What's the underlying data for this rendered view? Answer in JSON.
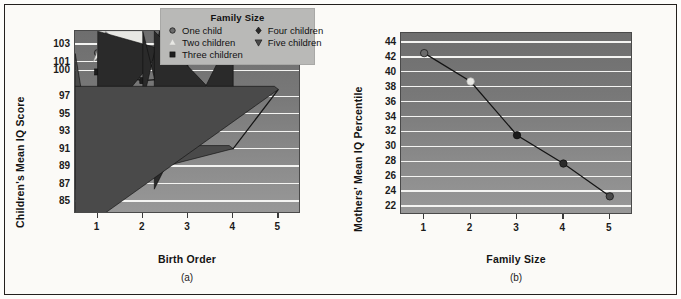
{
  "figure": {
    "background": "#fbfaf7",
    "frame_color": "#23201d"
  },
  "legend": {
    "title": "Family Size",
    "entries": [
      {
        "label": "One child",
        "marker": "circle",
        "color": "#6b6b6b",
        "column": 0
      },
      {
        "label": "Two children",
        "marker": "triangle-up",
        "color": "#e8e8e4",
        "column": 0
      },
      {
        "label": "Three children",
        "marker": "square",
        "color": "#1d1d1d",
        "column": 0
      },
      {
        "label": "Four children",
        "marker": "diamond",
        "color": "#2a2a2a",
        "column": 1
      },
      {
        "label": "Five children",
        "marker": "triangle-down",
        "color": "#4a4a4a",
        "column": 1
      }
    ]
  },
  "chart_data": [
    {
      "type": "line",
      "panel": "a",
      "caption": "(a)",
      "title": "",
      "xlabel": "Birth Order",
      "ylabel": "Children's Mean IQ Score",
      "x": [
        1,
        2,
        3,
        4,
        5
      ],
      "xticks": [
        "1",
        "2",
        "3",
        "4",
        "5"
      ],
      "yticks": [
        "103",
        "101",
        "100",
        "97",
        "95",
        "93",
        "91",
        "89",
        "87",
        "85"
      ],
      "ytick_values": [
        103,
        101,
        100,
        97,
        95,
        93,
        91,
        89,
        87,
        85
      ],
      "ylim": [
        83.5,
        104.5
      ],
      "xlim": [
        0.5,
        5.5
      ],
      "grid": true,
      "legend_position": "top-right-overlay",
      "series": [
        {
          "name": "One child",
          "marker": "circle",
          "color": "#6b6b6b",
          "x": [
            1
          ],
          "values": [
            102.0
          ]
        },
        {
          "name": "Two children",
          "marker": "triangle-up",
          "color": "#e8e8e4",
          "x": [
            1,
            2
          ],
          "values": [
            101.0,
            101.0
          ]
        },
        {
          "name": "Three children",
          "marker": "square",
          "color": "#1d1d1d",
          "x": [
            1,
            2,
            3
          ],
          "values": [
            99.8,
            98.8,
            99.2
          ]
        },
        {
          "name": "Four children",
          "marker": "diamond",
          "color": "#2a2a2a",
          "x": [
            1,
            2,
            3,
            4
          ],
          "values": [
            92.8,
            94.8,
            92.9,
            95.4
          ]
        },
        {
          "name": "Five children",
          "marker": "triangle-down",
          "color": "#4a4a4a",
          "x": [
            1,
            2,
            3,
            4,
            5
          ],
          "values": [
            86.4,
            90.9,
            91.1,
            91.0,
            97.8
          ]
        }
      ]
    },
    {
      "type": "line",
      "panel": "b",
      "caption": "(b)",
      "title": "",
      "xlabel": "Family Size",
      "ylabel": "Mothers' Mean IQ Percentile",
      "x": [
        1,
        2,
        3,
        4,
        5
      ],
      "xticks": [
        "1",
        "2",
        "3",
        "4",
        "5"
      ],
      "yticks": [
        "44",
        "42",
        "40",
        "38",
        "36",
        "34",
        "32",
        "30",
        "28",
        "26",
        "24",
        "22"
      ],
      "ytick_values": [
        44,
        42,
        40,
        38,
        36,
        34,
        32,
        30,
        28,
        26,
        24,
        22
      ],
      "ylim": [
        20.8,
        45.2
      ],
      "xlim": [
        0.5,
        5.5
      ],
      "grid": true,
      "legend_position": "none",
      "series": [
        {
          "name": "Mothers' Mean IQ Percentile",
          "marker": "circle",
          "color": "#1a1a1a",
          "line_color": "#141414",
          "x": [
            1,
            2,
            3,
            4,
            5
          ],
          "values": [
            42.5,
            38.7,
            31.5,
            27.7,
            23.3
          ],
          "point_colors": [
            "#6b6b6b",
            "#e8e8e4",
            "#1a1a1a",
            "#2a2a2a",
            "#4a4a4a"
          ]
        }
      ]
    }
  ]
}
